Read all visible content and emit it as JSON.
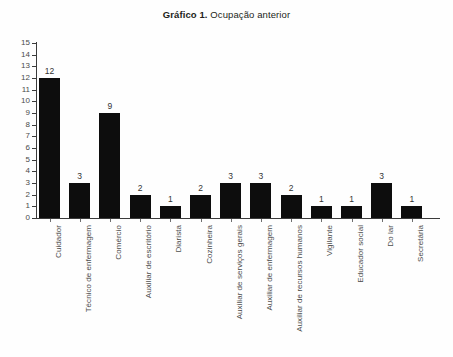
{
  "title": {
    "strong": "Gráfico 1.",
    "rest": " Ocupação anterior"
  },
  "chart_data": {
    "type": "bar",
    "title": "Gráfico 1. Ocupação anterior",
    "xlabel": "",
    "ylabel": "",
    "ylim": [
      0,
      15
    ],
    "ytick_step": 1,
    "grid": false,
    "legend": "none",
    "bar_color": "#0d0d0d",
    "show_value_labels": true,
    "xtick_label_rotation": 90,
    "yticks": [
      15,
      14,
      13,
      12,
      11,
      10,
      9,
      8,
      7,
      6,
      5,
      4,
      3,
      2,
      1,
      0
    ],
    "categories": [
      "Cuidador",
      "Técnico de enfermagem",
      "Comércio",
      "Auxiliar de escritório",
      "Diarista",
      "Cozinheira",
      "Auxiliar de serviços gerais",
      "Auxiliar de enfermagem",
      "Auxiliar de recursos humanos",
      "Vigilante",
      "Educador social",
      "Do lar",
      "Secretária"
    ],
    "values": [
      12,
      3,
      9,
      2,
      1,
      2,
      3,
      3,
      2,
      1,
      1,
      3,
      1
    ]
  }
}
